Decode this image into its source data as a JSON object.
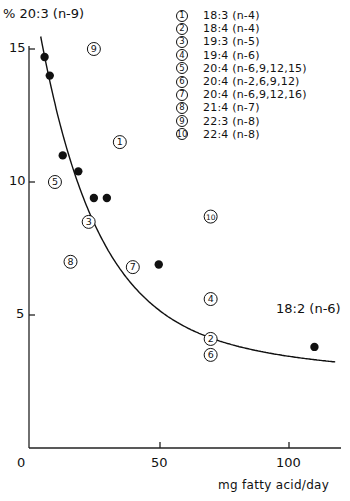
{
  "chart_data": {
    "type": "scatter",
    "title": "",
    "ylabel": "% 20:3 (n-9)",
    "xlabel": "mg fatty acid/day",
    "xlim": [
      0,
      120
    ],
    "ylim": [
      0,
      15.5
    ],
    "x_ticks": [
      "0",
      "50",
      "100"
    ],
    "y_ticks": [
      "5",
      "10",
      "15"
    ],
    "grid": false,
    "series": [
      {
        "name": "18:2 (n-6)",
        "marker": "filled-circle",
        "points": [
          {
            "x": 6,
            "y": 14.7
          },
          {
            "x": 8,
            "y": 14.0
          },
          {
            "x": 13,
            "y": 11.0
          },
          {
            "x": 19,
            "y": 10.4
          },
          {
            "x": 25,
            "y": 9.4
          },
          {
            "x": 30,
            "y": 9.4
          },
          {
            "x": 50,
            "y": 6.9
          },
          {
            "x": 110,
            "y": 3.8
          }
        ],
        "fit_curve": true
      },
      {
        "name": "other fatty acids (numbered)",
        "marker": "circled-number",
        "points": [
          {
            "id": 1,
            "x": 35,
            "y": 11.5
          },
          {
            "id": 2,
            "x": 70,
            "y": 4.1
          },
          {
            "id": 3,
            "x": 23,
            "y": 8.5
          },
          {
            "id": 4,
            "x": 70,
            "y": 5.6
          },
          {
            "id": 5,
            "x": 10,
            "y": 10.0
          },
          {
            "id": 6,
            "x": 70,
            "y": 3.5
          },
          {
            "id": 7,
            "x": 40,
            "y": 6.8
          },
          {
            "id": 8,
            "x": 16,
            "y": 7.0
          },
          {
            "id": 9,
            "x": 25,
            "y": 15.0
          },
          {
            "id": 10,
            "x": 70,
            "y": 8.7
          }
        ]
      }
    ],
    "curve_label": "18:2 (n-6)",
    "legend": [
      {
        "id": "1",
        "label": "18:3 (n-4)"
      },
      {
        "id": "2",
        "label": "18:4 (n-4)"
      },
      {
        "id": "3",
        "label": "19:3 (n-5)"
      },
      {
        "id": "4",
        "label": "19:4 (n-6)"
      },
      {
        "id": "5",
        "label": "20:4 (n-6,9,12,15)"
      },
      {
        "id": "6",
        "label": "20:4 (n-2,6,9,12)"
      },
      {
        "id": "7",
        "label": "20:4 (n-6,9,12,16)"
      },
      {
        "id": "8",
        "label": "21:4 (n-7)"
      },
      {
        "id": "9",
        "label": "22:3 (n-8)"
      },
      {
        "id": "10",
        "label": "22:4 (n-8)"
      }
    ],
    "legend_position": "top-right"
  }
}
